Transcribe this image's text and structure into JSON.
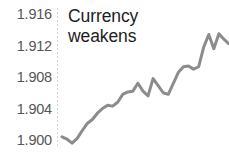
{
  "chart_data": {
    "type": "line",
    "title": "Currency\nweakens",
    "xlabel": "",
    "ylabel": "",
    "ylim": [
      1.8985,
      1.9165
    ],
    "yticks": [
      1.9,
      1.904,
      1.908,
      1.912,
      1.916
    ],
    "ytick_labels": [
      "1.900",
      "1.904",
      "1.908",
      "1.912",
      "1.916"
    ],
    "grid": false,
    "legend": null,
    "line_color": "#8c8c8c",
    "line_width": 3,
    "axis_color": "#d8d8d8",
    "tick_label_color": "#565656",
    "title_color": "#1d1d1d",
    "x": [
      0,
      1,
      2,
      3,
      4,
      5,
      6,
      7,
      8,
      9,
      10,
      11,
      12,
      13,
      14,
      15,
      16,
      17,
      18,
      19,
      20,
      21,
      22,
      23,
      24,
      25,
      26,
      27,
      28,
      29,
      30,
      31,
      32,
      33
    ],
    "values": [
      1.9004,
      1.9001,
      1.8996,
      1.9002,
      1.9012,
      1.9021,
      1.9026,
      1.9034,
      1.904,
      1.9044,
      1.9043,
      1.9048,
      1.9058,
      1.9061,
      1.9062,
      1.9072,
      1.9062,
      1.9056,
      1.9078,
      1.9069,
      1.906,
      1.9058,
      1.9072,
      1.9086,
      1.9093,
      1.9094,
      1.909,
      1.9093,
      1.9118,
      1.9134,
      1.9116,
      1.9135,
      1.9128,
      1.9122
    ]
  },
  "annotations": {
    "title_line1": "Currency",
    "title_line2": "weakens"
  }
}
